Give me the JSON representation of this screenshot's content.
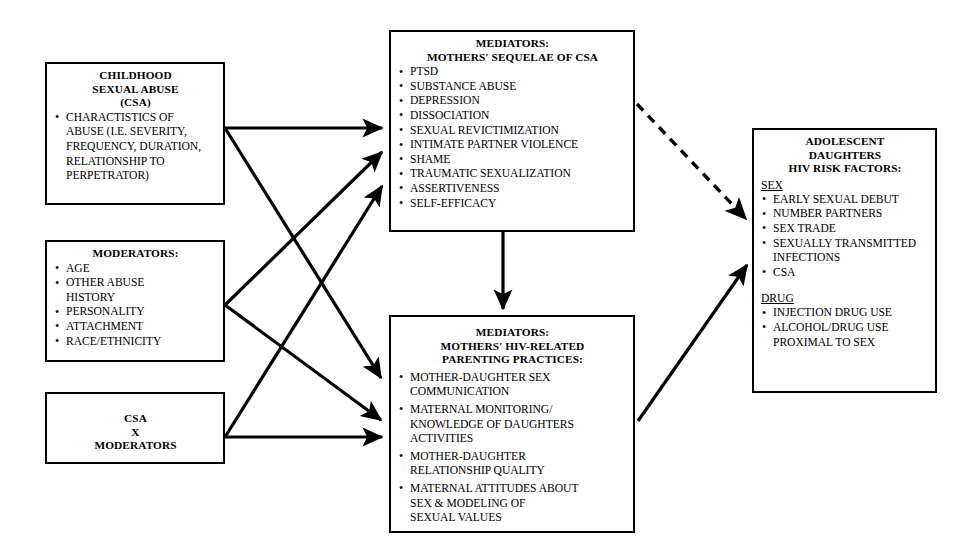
{
  "boxes": {
    "csa": {
      "title": "CHILDHOOD\nSEXUAL ABUSE\n(CSA)",
      "items": [
        "CHARACTISTICS OF\nABUSE (I.E. SEVERITY,\nFREQUENCY, DURATION,\nRELATIONSHIP TO\nPERPETRATOR)"
      ]
    },
    "moderators": {
      "title": "MODERATORS:",
      "items": [
        "AGE",
        "OTHER ABUSE\nHISTORY",
        "PERSONALITY",
        "ATTACHMENT",
        "RACE/ETHNICITY"
      ]
    },
    "csa_x_moderators": {
      "title": "CSA\nX\nMODERATORS"
    },
    "mediators_sequelae": {
      "title": "MEDIATORS:\nMOTHERS' SEQUELAE OF CSA",
      "items": [
        "PTSD",
        "SUBSTANCE ABUSE",
        "DEPRESSION",
        "DISSOCIATION",
        "SEXUAL REVICTIMIZATION",
        "INTIMATE PARTNER VIOLENCE",
        "SHAME",
        "TRAUMATIC SEXUALIZATION",
        "ASSERTIVENESS",
        "SELF-EFFICACY"
      ]
    },
    "mediators_parenting": {
      "title": "MEDIATORS:\nMOTHERS' HIV-RELATED\nPARENTING PRACTICES:",
      "items": [
        "MOTHER-DAUGHTER SEX\nCOMMUNICATION",
        "MATERNAL MONITORING/\nKNOWLEDGE OF DAUGHTERS\nACTIVITIES",
        "MOTHER-DAUGHTER\nRELATIONSHIP QUALITY",
        "MATERNAL ATTITUDES  ABOUT\nSEX & MODELING OF\nSEXUAL VALUES"
      ]
    },
    "outcome": {
      "title": "ADOLESCENT\nDAUGHTERS\nHIV RISK FACTORS:",
      "sections": [
        {
          "heading": "SEX",
          "items": [
            "EARLY SEXUAL DEBUT",
            "NUMBER PARTNERS",
            "SEX TRADE",
            "SEXUALLY TRANSMITTED\nINFECTIONS",
            "CSA"
          ]
        },
        {
          "heading": "DRUG",
          "items": [
            "INJECTION DRUG USE",
            "ALCOHOL/DRUG USE\nPROXIMAL TO SEX"
          ]
        }
      ]
    }
  },
  "arrows": [
    {
      "name": "csa-to-mediators-sequelae",
      "style": "solid",
      "from": "csa",
      "to": "mediators_sequelae"
    },
    {
      "name": "csa-to-mediators-parenting",
      "style": "solid",
      "from": "csa",
      "to": "mediators_parenting"
    },
    {
      "name": "moderators-to-mediators-sequelae",
      "style": "solid",
      "from": "moderators",
      "to": "mediators_sequelae"
    },
    {
      "name": "moderators-to-mediators-parenting",
      "style": "solid",
      "from": "moderators",
      "to": "mediators_parenting"
    },
    {
      "name": "csa-x-moderators-to-sequelae",
      "style": "solid",
      "from": "csa_x_moderators",
      "to": "mediators_sequelae"
    },
    {
      "name": "csa-x-moderators-to-parenting",
      "style": "solid",
      "from": "csa_x_moderators",
      "to": "mediators_parenting"
    },
    {
      "name": "sequelae-to-parenting",
      "style": "solid",
      "from": "mediators_sequelae",
      "to": "mediators_parenting"
    },
    {
      "name": "sequelae-to-outcome",
      "style": "dashed",
      "from": "mediators_sequelae",
      "to": "outcome"
    },
    {
      "name": "parenting-to-outcome",
      "style": "solid",
      "from": "mediators_parenting",
      "to": "outcome"
    }
  ],
  "colors": {
    "line": "#000000",
    "background": "#ffffff",
    "text": "#000000"
  }
}
